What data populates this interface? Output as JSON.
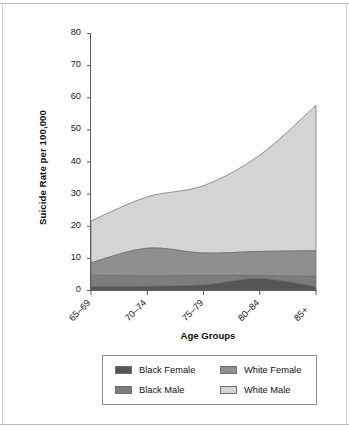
{
  "figure": {
    "background_color": "#ffffff",
    "border_color": "#b9b9b9"
  },
  "chart_data": {
    "type": "area",
    "stacked": true,
    "title": "",
    "xlabel": "Age Groups",
    "ylabel": "Suicide Rate per 100,000",
    "categories": [
      "65–69",
      "70–74",
      "75–79",
      "80–84",
      "85+"
    ],
    "ylim": [
      0,
      80
    ],
    "yticks": [
      0,
      10,
      20,
      30,
      40,
      50,
      60,
      70,
      80
    ],
    "ytick_labels": [
      "0",
      "10",
      "20",
      "30",
      "40",
      "50",
      "60",
      "70",
      "80"
    ],
    "grid": false,
    "legend_position": "bottom",
    "series": [
      {
        "name": "Black Female",
        "color": "#555555",
        "values": [
          1.0,
          1.2,
          1.6,
          3.6,
          1.0
        ],
        "cumulative": [
          1.0,
          1.2,
          1.6,
          3.6,
          1.0
        ]
      },
      {
        "name": "Black Male",
        "color": "#7d7d7d",
        "values": [
          3.6,
          3.2,
          2.9,
          0.9,
          3.2
        ],
        "cumulative": [
          4.6,
          4.4,
          4.5,
          4.5,
          4.2
        ]
      },
      {
        "name": "White Female",
        "color": "#8f8f8f",
        "values": [
          3.9,
          8.6,
          7.0,
          7.5,
          8.0
        ],
        "cumulative": [
          8.5,
          13.0,
          11.5,
          12.0,
          12.2
        ]
      },
      {
        "name": "White Male",
        "color": "#d4d4d4",
        "values": [
          13.0,
          16.0,
          21.0,
          30.0,
          45.3
        ],
        "cumulative": [
          21.5,
          29.0,
          32.5,
          42.0,
          57.5
        ]
      }
    ]
  },
  "axis": {
    "y_title": "Suicide Rate per 100,000",
    "x_title": "Age Groups",
    "y_labels": [
      "80",
      "70",
      "60",
      "50",
      "40",
      "30",
      "20",
      "10",
      "0"
    ],
    "x_labels": [
      "65–69",
      "70–74",
      "75–79",
      "80–84",
      "85+"
    ]
  },
  "legend": {
    "entries": [
      {
        "label": "Black Female",
        "color": "#555555"
      },
      {
        "label": "White Female",
        "color": "#8f8f8f"
      },
      {
        "label": "Black Male",
        "color": "#7d7d7d"
      },
      {
        "label": "White Male",
        "color": "#d4d4d4"
      }
    ]
  }
}
